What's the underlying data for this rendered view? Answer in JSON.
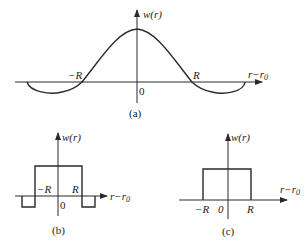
{
  "panels": [
    {
      "id": "a",
      "caption": "(a)",
      "y_axis_label": "w(r)",
      "x_axis_label": "r−r",
      "x_axis_subscript": "0",
      "origin_label": "0",
      "tick_labels": [
        "−R",
        "R"
      ],
      "shape": "smooth bell with negative side lobes (Mexican-hat)"
    },
    {
      "id": "b",
      "caption": "(b)",
      "y_axis_label": "w(r)",
      "x_axis_label": "r−r",
      "x_axis_subscript": "0",
      "origin_label": "0",
      "tick_labels": [
        "−R",
        "R"
      ],
      "shape": "rectangular pulse with negative rectangular side lobes"
    },
    {
      "id": "c",
      "caption": "(c)",
      "y_axis_label": "w(r)",
      "x_axis_label": "r−r",
      "x_axis_subscript": "0",
      "origin_label": "0",
      "tick_labels": [
        "−R",
        "R"
      ],
      "shape": "rectangular pulse from −R to R"
    }
  ],
  "colors": {
    "line": "#2a2a2a",
    "background": "#ffffff"
  }
}
